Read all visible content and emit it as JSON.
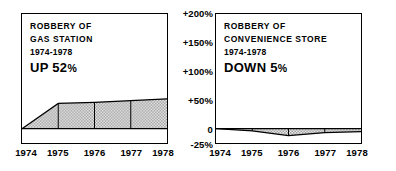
{
  "figure": {
    "background_color": "#ffffff",
    "ink_color": "#000000",
    "fill_color": "#c8c8c8"
  },
  "y_axis": {
    "position": "center",
    "labels": [
      "+200%",
      "+150%",
      "+100%",
      "+50%",
      "0",
      "-25%"
    ],
    "values": [
      200,
      150,
      100,
      50,
      0,
      -25
    ],
    "range": [
      -25,
      200
    ]
  },
  "panels": [
    {
      "id": "gas-station",
      "caption": {
        "title_line1": "ROBBERY OF",
        "title_line2": "GAS STATION",
        "years": "1974-1978",
        "headline_word": "UP 52",
        "headline_pct": "%"
      },
      "x_labels": [
        "1974",
        "1975",
        "1976",
        "1977",
        "1978"
      ]
    },
    {
      "id": "convenience-store",
      "caption": {
        "title_line1": "ROBBERY OF",
        "title_line2": "CONVENIENCE STORE",
        "years": "1974-1978",
        "headline_word": "DOWN 5",
        "headline_pct": "%"
      },
      "x_labels": [
        "1974",
        "1975",
        "1976",
        "1977",
        "1978"
      ]
    }
  ],
  "chart_data": {
    "type": "area",
    "xlabel": "",
    "ylabel": "Percent change",
    "x": [
      1974,
      1975,
      1976,
      1977,
      1978
    ],
    "categories": [
      "1974",
      "1975",
      "1976",
      "1977",
      "1978"
    ],
    "ylim": [
      -25,
      200
    ],
    "yticks": [
      -25,
      0,
      50,
      100,
      150,
      200
    ],
    "ytick_labels": [
      "-25%",
      "0",
      "+50%",
      "+100%",
      "+150%",
      "+200%"
    ],
    "grid": true,
    "legend": "none",
    "series": [
      {
        "name": "Robbery of gas station",
        "panel": "gas-station",
        "values": [
          0,
          44,
          46,
          49,
          52
        ],
        "annotation": "UP 52%"
      },
      {
        "name": "Robbery of convenience store",
        "panel": "convenience-store",
        "values": [
          0,
          -4,
          -12,
          -7,
          -5
        ],
        "annotation": "DOWN 5%"
      }
    ]
  }
}
